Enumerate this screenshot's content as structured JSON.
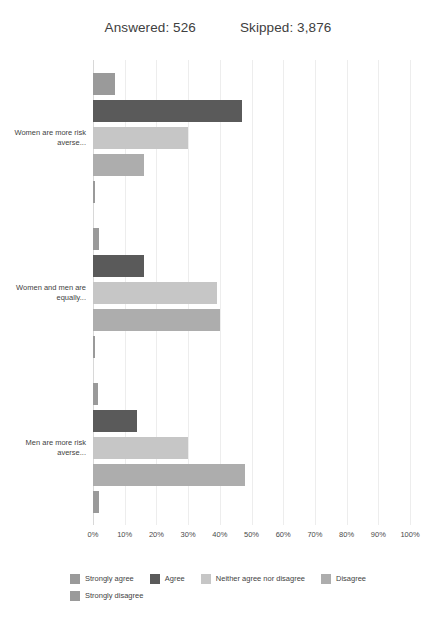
{
  "header": {
    "answered_label": "Answered: 526",
    "skipped_label": "Skipped: 3,876"
  },
  "chart_data": {
    "type": "bar",
    "orientation": "horizontal",
    "title": "",
    "xlabel": "",
    "ylabel": "",
    "xlim": [
      0,
      100
    ],
    "grid": true,
    "legend_position": "bottom",
    "value_unit": "%",
    "categories": [
      "Women are more risk averse...",
      "Women and men are equally...",
      "Men are more risk averse..."
    ],
    "xticks": [
      "0%",
      "10%",
      "20%",
      "30%",
      "40%",
      "50%",
      "60%",
      "70%",
      "80%",
      "90%",
      "100%"
    ],
    "xtick_values": [
      0,
      10,
      20,
      30,
      40,
      50,
      60,
      70,
      80,
      90,
      100
    ],
    "series": [
      {
        "name": "Strongly agree",
        "color": "#9a9a9a",
        "values": [
          7,
          2,
          1.5
        ]
      },
      {
        "name": "Agree",
        "color": "#5a5a5a",
        "values": [
          47,
          16,
          14
        ]
      },
      {
        "name": "Neither agree nor disagree",
        "color": "#c6c6c6",
        "values": [
          30,
          39,
          30
        ]
      },
      {
        "name": "Disagree",
        "color": "#adadad",
        "values": [
          16,
          40,
          48
        ]
      },
      {
        "name": "Strongly disagree",
        "color": "#9a9a9a",
        "values": [
          0.5,
          0.5,
          2
        ]
      }
    ]
  }
}
